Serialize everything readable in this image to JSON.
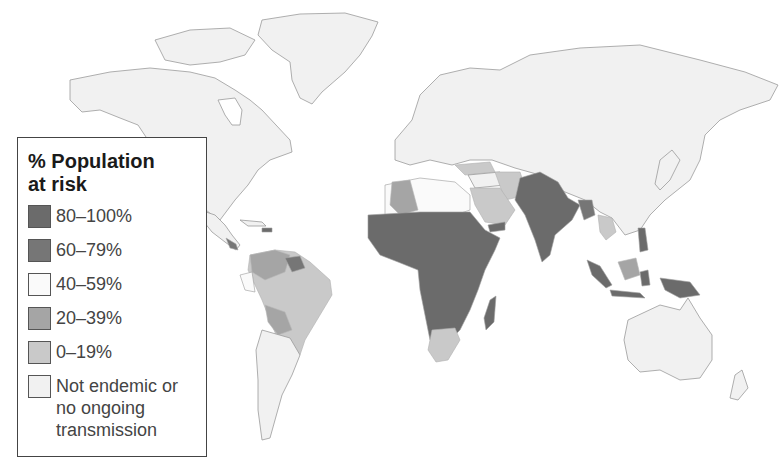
{
  "legend": {
    "title_line1": "% Population",
    "title_line2": "at risk",
    "items": [
      {
        "label": "80–100%",
        "color": "#6b6b6b"
      },
      {
        "label": "60–79%",
        "color": "#767676"
      },
      {
        "label": "40–59%",
        "color": "#fafafa"
      },
      {
        "label": "20–39%",
        "color": "#a5a5a5"
      },
      {
        "label": "0–19%",
        "color": "#c9c9c9"
      },
      {
        "label_line1": "Not endemic or",
        "label_line2": "no ongoing",
        "label_line3": "transmission",
        "color": "#f1f1f1"
      }
    ]
  },
  "map": {
    "regions": {
      "80-100": [
        "Sub-Saharan Africa",
        "India",
        "Pakistan",
        "Yemen",
        "Indonesia",
        "Papua New Guinea",
        "Philippines",
        "Madagascar"
      ],
      "60-79": [
        "Central Africa",
        "Myanmar",
        "Guyana region"
      ],
      "40-59": [
        "Northern Africa (Libya/Egypt)",
        "Ecuador coast"
      ],
      "20-39": [
        "Colombia/Venezuela",
        "Bolivia",
        "Algeria",
        "Borneo"
      ],
      "0-19": [
        "Brazil",
        "Saudi Arabia",
        "Iran",
        "Turkey",
        "South Africa",
        "Southeast Asia mainland"
      ],
      "not_endemic": [
        "North America",
        "Europe",
        "Russia",
        "China",
        "Australia",
        "Argentina",
        "Greenland"
      ]
    }
  }
}
